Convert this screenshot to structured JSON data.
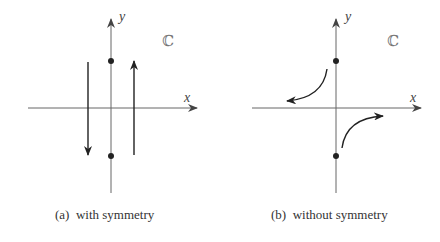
{
  "panels": [
    {
      "id": "a",
      "caption": "(a)  with symmetry",
      "x_label": "x",
      "y_label": "y",
      "plane_label": "ℂ",
      "points": [
        {
          "x": 0,
          "y": 1
        },
        {
          "x": 0,
          "y": -1
        }
      ],
      "paths": [
        "vertical line left of imaginary axis, directed downward",
        "vertical line right of imaginary axis, directed upward"
      ]
    },
    {
      "id": "b",
      "caption": "(b)  without symmetry",
      "x_label": "x",
      "y_label": "y",
      "plane_label": "ℂ",
      "points": [
        {
          "x": 0,
          "y": 1
        },
        {
          "x": 0,
          "y": -1
        }
      ],
      "paths": [
        "curve in upper-left quadrant bending toward negative real axis",
        "curve in lower-right quadrant bending toward positive real axis"
      ]
    }
  ]
}
